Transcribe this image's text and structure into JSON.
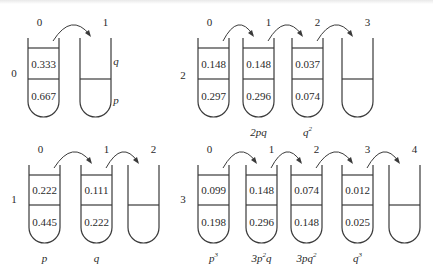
{
  "colors": {
    "stroke": "#3a3a3a",
    "text": "#2a2a2a",
    "background": "#ffffff"
  },
  "panels": [
    {
      "id": "gen0",
      "row_label": "0",
      "row_label_pos": [
        14,
        77
      ],
      "tube_top": 38,
      "tube_bottom": 117,
      "line1": 48,
      "line2": 79,
      "tubes": [
        {
          "index_label": "0",
          "x": 28,
          "w": 31,
          "upper": "0.333",
          "lower": "0.667",
          "below": ""
        },
        {
          "index_label": "1",
          "x": 80,
          "w": 31,
          "upper": "",
          "lower": "",
          "below": "",
          "empty": true
        }
      ],
      "side_labels": [
        {
          "text": "q",
          "x": 116,
          "y": 65
        },
        {
          "text": "p",
          "x": 116,
          "y": 104
        }
      ]
    },
    {
      "id": "gen2",
      "row_label": "2",
      "row_label_pos": [
        183,
        79
      ],
      "tube_top": 38,
      "tube_bottom": 117,
      "line1": 48,
      "line2": 79,
      "tubes": [
        {
          "index_label": "0",
          "x": 198,
          "w": 31,
          "upper": "0.148",
          "lower": "0.297",
          "below": ""
        },
        {
          "index_label": "1",
          "x": 243,
          "w": 31,
          "upper": "0.148",
          "lower": "0.296",
          "below": "2pq"
        },
        {
          "index_label": "2",
          "x": 292,
          "w": 31,
          "upper": "0.037",
          "lower": "0.074",
          "below": "q",
          "below_sup": "2"
        },
        {
          "index_label": "3",
          "x": 342,
          "w": 31,
          "upper": "",
          "lower": "",
          "below": "",
          "empty": true
        }
      ]
    },
    {
      "id": "gen1",
      "row_label": "1",
      "row_label_pos": [
        14,
        203
      ],
      "tube_top": 165,
      "tube_bottom": 243,
      "line1": 175,
      "line2": 205,
      "tubes": [
        {
          "index_label": "0",
          "x": 29,
          "w": 31,
          "upper": "0.222",
          "lower": "0.445",
          "below": "p"
        },
        {
          "index_label": "1",
          "x": 81,
          "w": 31,
          "upper": "0.111",
          "lower": "0.222",
          "below": "q"
        },
        {
          "index_label": "2",
          "x": 128,
          "w": 31,
          "upper": "",
          "lower": "",
          "below": "",
          "empty": true
        }
      ]
    },
    {
      "id": "gen3",
      "row_label": "3",
      "row_label_pos": [
        183,
        203
      ],
      "tube_top": 165,
      "tube_bottom": 243,
      "line1": 175,
      "line2": 205,
      "tubes": [
        {
          "index_label": "0",
          "x": 198,
          "w": 31,
          "upper": "0.099",
          "lower": "0.198",
          "below": "p",
          "below_sup": "3"
        },
        {
          "index_label": "1",
          "x": 246,
          "w": 31,
          "upper": "0.148",
          "lower": "0.296",
          "below": "3p",
          "below_sup": "2",
          "below_tail": "q"
        },
        {
          "index_label": "2",
          "x": 291,
          "w": 31,
          "upper": "0.074",
          "lower": "0.148",
          "below": "3pq",
          "below_sup": "2"
        },
        {
          "index_label": "3",
          "x": 342,
          "w": 31,
          "upper": "0.012",
          "lower": "0.025",
          "below": "q",
          "below_sup": "3"
        },
        {
          "index_label": "4",
          "x": 389,
          "w": 31,
          "upper": "",
          "lower": "",
          "below": "",
          "empty": true
        }
      ]
    }
  ]
}
